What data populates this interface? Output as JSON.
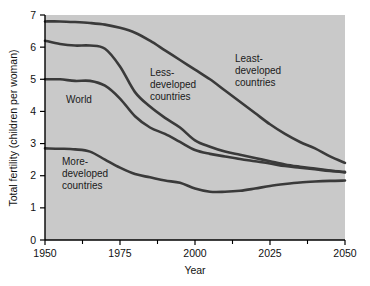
{
  "chart_data": {
    "type": "line",
    "title": "",
    "xlabel": "Year",
    "ylabel": "Total fertility (children per woman)",
    "xlim": [
      1950,
      2050
    ],
    "ylim": [
      0,
      7
    ],
    "grid": false,
    "legend_position": "inline-annotations",
    "x_ticks": [
      1950,
      1975,
      2000,
      2025,
      2050
    ],
    "x_tick_labels": [
      "1950",
      "1975",
      "2000",
      "2025",
      "2050"
    ],
    "x_minor_ticks": [
      1962.5,
      1987.5,
      2012.5,
      2037.5
    ],
    "y_ticks": [
      0,
      1,
      2,
      3,
      4,
      5,
      6,
      7
    ],
    "y_tick_labels": [
      "0",
      "1",
      "2",
      "3",
      "4",
      "5",
      "6",
      "7"
    ],
    "x": [
      1950,
      1955,
      1960,
      1965,
      1970,
      1975,
      1980,
      1985,
      1990,
      1995,
      2000,
      2005,
      2010,
      2015,
      2020,
      2025,
      2030,
      2035,
      2040,
      2045,
      2050
    ],
    "series": [
      {
        "name": "Least-developed countries",
        "values": [
          6.8,
          6.8,
          6.78,
          6.75,
          6.7,
          6.6,
          6.45,
          6.2,
          5.9,
          5.6,
          5.3,
          5.0,
          4.65,
          4.3,
          3.95,
          3.6,
          3.3,
          3.05,
          2.85,
          2.6,
          2.4
        ]
      },
      {
        "name": "Less-developed countries",
        "values": [
          6.2,
          6.1,
          6.05,
          6.05,
          5.95,
          5.4,
          4.6,
          4.15,
          3.8,
          3.5,
          3.1,
          2.9,
          2.75,
          2.65,
          2.55,
          2.45,
          2.35,
          2.28,
          2.22,
          2.16,
          2.1
        ]
      },
      {
        "name": "World",
        "values": [
          5.0,
          5.0,
          4.95,
          4.95,
          4.8,
          4.4,
          3.85,
          3.5,
          3.3,
          3.05,
          2.8,
          2.68,
          2.6,
          2.52,
          2.45,
          2.38,
          2.3,
          2.25,
          2.2,
          2.15,
          2.12
        ]
      },
      {
        "name": "More-developed countries",
        "values": [
          2.85,
          2.84,
          2.82,
          2.75,
          2.5,
          2.25,
          2.05,
          1.95,
          1.85,
          1.78,
          1.6,
          1.5,
          1.5,
          1.53,
          1.6,
          1.68,
          1.74,
          1.79,
          1.82,
          1.84,
          1.85
        ]
      }
    ],
    "annotations": [
      {
        "text_lines": [
          "World"
        ],
        "near_series": "World"
      },
      {
        "text_lines": [
          "More-",
          "developed",
          "countries"
        ],
        "near_series": "More-developed countries"
      },
      {
        "text_lines": [
          "Less-",
          "developed",
          "countries"
        ],
        "near_series": "Less-developed countries"
      },
      {
        "text_lines": [
          "Least-",
          "developed",
          "countries"
        ],
        "near_series": "Least-developed countries"
      }
    ],
    "colors": {
      "plot_background": "#c9c9c9",
      "curve": "#3a3a3a",
      "axis": "#000000",
      "text": "#111111",
      "page_background": "#ffffff"
    }
  },
  "labels": {
    "y_axis_title": "Total fertility (children per woman)",
    "x_axis_title": "Year",
    "y_0": "0",
    "y_1": "1",
    "y_2": "2",
    "y_3": "3",
    "y_4": "4",
    "y_5": "5",
    "y_6": "6",
    "y_7": "7",
    "x_1950": "1950",
    "x_1975": "1975",
    "x_2000": "2000",
    "x_2025": "2025",
    "x_2050": "2050",
    "ann_world": "World",
    "ann_more_1": "More-",
    "ann_more_2": "developed",
    "ann_more_3": "countries",
    "ann_less_1": "Less-",
    "ann_less_2": "developed",
    "ann_less_3": "countries",
    "ann_least_1": "Least-",
    "ann_least_2": "developed",
    "ann_least_3": "countries"
  }
}
